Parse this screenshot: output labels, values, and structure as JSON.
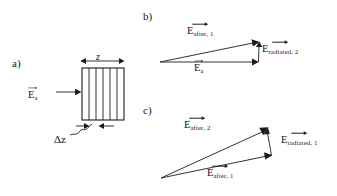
{
  "figure": {
    "width": 337,
    "height": 196,
    "background": "#ffffff",
    "ink": "#1b1b1b"
  },
  "panels": {
    "a": {
      "label": "a)",
      "label_x": 12,
      "label_y": 57,
      "incident_field": {
        "symbol": "E",
        "subscript": "a",
        "has_vector_arrow": true,
        "x": 30,
        "y": 92
      },
      "thickness_label": {
        "text": "z",
        "x": 96,
        "y": 55
      },
      "slice_label": {
        "text": "Δz",
        "x": 54,
        "y": 137
      },
      "slab": {
        "x": 82,
        "y": 68,
        "width": 42,
        "height": 52,
        "internal_divisions": 5
      }
    },
    "b": {
      "label": "b)",
      "label_x": 143,
      "label_y": 10,
      "vectors": [
        {
          "name": "E_after_1",
          "symbol": "E",
          "subscript": "after, 1",
          "has_vector_arrow": true,
          "label_x": 187,
          "label_y": 28
        },
        {
          "name": "E_radiated_2",
          "symbol": "E",
          "subscript": "radiated, 2",
          "has_vector_arrow": true,
          "label_x": 262,
          "label_y": 46
        },
        {
          "name": "E_a",
          "symbol": "E",
          "subscript": "a",
          "has_vector_arrow": true,
          "label_x": 194,
          "label_y": 65
        }
      ],
      "geometry": {
        "origin_x": 160,
        "origin_y": 62,
        "tip_x": 258,
        "tip_y": 62,
        "upper_tip_x": 259,
        "upper_tip_y": 42
      }
    },
    "c": {
      "label": "c)",
      "label_x": 143,
      "label_y": 104,
      "vectors": [
        {
          "name": "E_after_2",
          "symbol": "E",
          "subscript": "after, 2",
          "has_vector_arrow": true,
          "label_x": 184,
          "label_y": 122
        },
        {
          "name": "E_radiated_1",
          "symbol": "E",
          "subscript": "radiated, 1",
          "has_vector_arrow": true,
          "label_x": 281,
          "label_y": 137
        },
        {
          "name": "E_after_1",
          "symbol": "E",
          "subscript": "after, 1",
          "label_x": 207,
          "label_y": 170,
          "has_vector_arrow": true
        }
      ],
      "geometry": {
        "origin_x": 161,
        "origin_y": 178,
        "tip_x": 272,
        "tip_y": 155,
        "upper_tip_x": 268,
        "upper_tip_y": 128
      }
    }
  }
}
